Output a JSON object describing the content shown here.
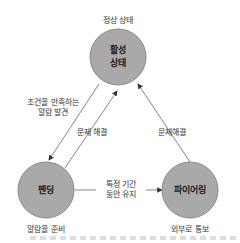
{
  "diagram": {
    "nodes": [
      {
        "id": "active",
        "label_line1": "활성",
        "label_line2": "상태",
        "caption": "정상 상태"
      },
      {
        "id": "pending",
        "label": "펜딩",
        "caption": "알람을 준비"
      },
      {
        "id": "firing",
        "label": "파이어링",
        "caption": "외부로 통보"
      }
    ],
    "edges": [
      {
        "from": "active",
        "to": "pending",
        "label_line1": "조건을 만족하는",
        "label_line2": "알람 발견"
      },
      {
        "from": "pending",
        "to": "active",
        "label": "문제 해결"
      },
      {
        "from": "firing",
        "to": "active",
        "label": "문제해결"
      },
      {
        "from": "pending",
        "to": "firing",
        "label_line1": "특정 기간",
        "label_line2": "동안 유지"
      }
    ],
    "colors": {
      "node_fill": "#a8a8a8",
      "node_stroke": "#8c8c8c",
      "edge": "#555555"
    }
  }
}
